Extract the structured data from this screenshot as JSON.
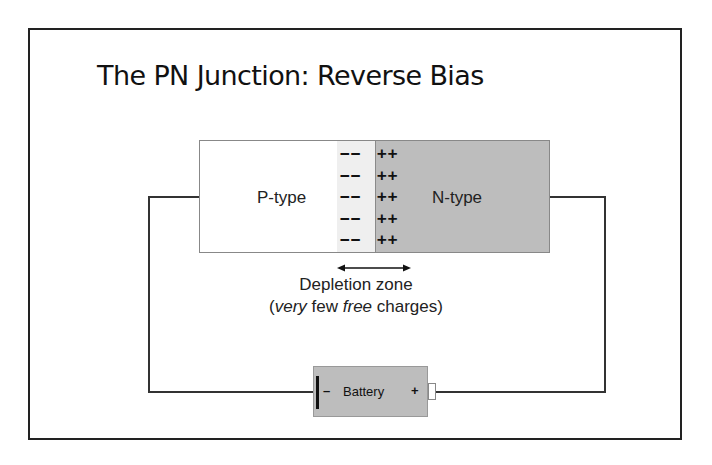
{
  "slide": {
    "title": "The PN Junction: Reverse Bias"
  },
  "diagram": {
    "p_region_label": "P-type",
    "n_region_label": "N-type",
    "negative_charges": "−−\n−−\n−−\n−−\n−−",
    "positive_charges": "++\n++\n++\n++\n++",
    "depletion_label": "Depletion zone",
    "depletion_note": {
      "open": "(",
      "very": "very",
      "mid": " few ",
      "free": "free",
      "end": " charges)"
    },
    "battery": {
      "label": "Battery",
      "negative_symbol": "–",
      "positive_symbol": "+"
    },
    "colors": {
      "n_region": "#bdbdbd",
      "p_depletion": "#efefef",
      "p_region": "#ffffff",
      "wire": "#333333"
    }
  }
}
